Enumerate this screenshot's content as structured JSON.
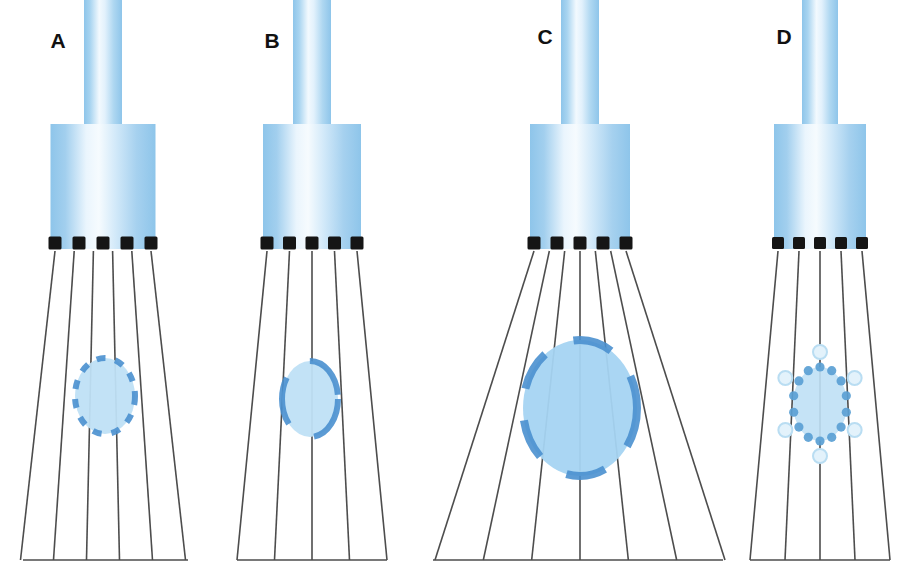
{
  "figure": {
    "background_color": "#ffffff",
    "width": 915,
    "height": 565,
    "panel_count": 4
  },
  "palette": {
    "cylinder_edge_blue": "#8ec5ea",
    "cylinder_mid_blue": "#a8d4f0",
    "cylinder_highlight": "#f2f9fe",
    "beam_line": "#4d4d4d",
    "element_black": "#151515",
    "focus_fill_light": "#bfe0f5",
    "focus_fill_strong": "#a5d4f2",
    "focus_stroke": "#4a90cf",
    "dot_solid": "#5a9fd4",
    "dot_hollow_fill": "#e3f2fb",
    "dot_hollow_stroke": "#b9ddf2",
    "label_text": "#111111"
  },
  "panels": [
    {
      "id": "panel-a",
      "label": "A",
      "label_x": 58,
      "label_y": 48,
      "stem": {
        "cx": 103,
        "top": 0,
        "bottom": 124,
        "width": 38
      },
      "barrel": {
        "cx": 103,
        "top": 124,
        "bottom": 249,
        "width": 105
      },
      "elements": {
        "count": 5,
        "y": 243,
        "size": 13,
        "span": 96
      },
      "fan": {
        "top_y": 251,
        "bottom_y": 560,
        "top_span": 96,
        "bottom_span": 165,
        "line_count": 6
      },
      "baseline": {
        "y": 560,
        "x1": 23,
        "x2": 188
      },
      "focus": {
        "shape": "dashed-ellipse",
        "cx": 105,
        "cy": 396,
        "rx": 30,
        "ry": 38,
        "stroke_width": 6,
        "dash_pattern": "9 10",
        "fill": "#bfe0f5",
        "stroke": "#4a90cf",
        "description": "small focal zone, short dashes, many segments"
      }
    },
    {
      "id": "panel-b",
      "label": "B",
      "label_x": 272,
      "label_y": 48,
      "stem": {
        "cx": 312,
        "top": 0,
        "bottom": 124,
        "width": 38
      },
      "barrel": {
        "cx": 312,
        "top": 124,
        "bottom": 249,
        "width": 98
      },
      "elements": {
        "count": 5,
        "y": 243,
        "size": 13,
        "span": 90
      },
      "fan": {
        "top_y": 251,
        "bottom_y": 560,
        "top_span": 90,
        "bottom_span": 150,
        "line_count": 5
      },
      "baseline": {
        "y": 560,
        "x1": 237,
        "x2": 387
      },
      "focus": {
        "shape": "dashed-ellipse",
        "cx": 310,
        "cy": 399,
        "rx": 28,
        "ry": 38,
        "stroke_width": 6,
        "dash_pattern": "48 30",
        "fill": "#bfe0f5",
        "stroke": "#4a90cf",
        "description": "small focal zone, long arc segments"
      }
    },
    {
      "id": "panel-c",
      "label": "C",
      "label_x": 545,
      "label_y": 44,
      "stem": {
        "cx": 580,
        "top": 0,
        "bottom": 124,
        "width": 38
      },
      "barrel": {
        "cx": 580,
        "top": 124,
        "bottom": 249,
        "width": 100
      },
      "elements": {
        "count": 5,
        "y": 243,
        "size": 13,
        "span": 92
      },
      "fan": {
        "top_y": 251,
        "bottom_y": 560,
        "top_span": 92,
        "bottom_span": 290,
        "line_count": 7
      },
      "baseline": {
        "y": 560,
        "x1": 433,
        "x2": 723
      },
      "focus": {
        "shape": "dashed-ellipse",
        "cx": 580,
        "cy": 408,
        "rx": 57,
        "ry": 68,
        "stroke_width": 8,
        "dash_pattern": "40 32",
        "fill": "#a5d4f2",
        "stroke": "#4a90cf",
        "description": "large focal zone, medium dashes, stronger fill"
      }
    },
    {
      "id": "panel-d",
      "label": "D",
      "label_x": 784,
      "label_y": 44,
      "stem": {
        "cx": 820,
        "top": 0,
        "bottom": 124,
        "width": 36
      },
      "barrel": {
        "cx": 820,
        "top": 124,
        "bottom": 249,
        "width": 92
      },
      "elements": {
        "count": 5,
        "y": 243,
        "size": 12,
        "span": 84
      },
      "fan": {
        "top_y": 251,
        "bottom_y": 560,
        "top_span": 84,
        "bottom_span": 140,
        "line_count": 5
      },
      "baseline": {
        "y": 560,
        "x1": 750,
        "x2": 890
      },
      "focus": {
        "shape": "dotted-ellipse",
        "cx": 820,
        "cy": 404,
        "rx": 27,
        "ry": 37,
        "fill": "#bfe0f5",
        "inner_dots": {
          "count": 14,
          "radius": 4.6,
          "color": "#5a9fd4"
        },
        "outer_dots": {
          "count": 6,
          "radius": 7.0,
          "fill": "#e3f2fb",
          "stroke": "#b9ddf2",
          "rx": 40,
          "ry": 52
        },
        "description": "small focal zone rendered as discrete dots with outer halo circles"
      }
    }
  ]
}
